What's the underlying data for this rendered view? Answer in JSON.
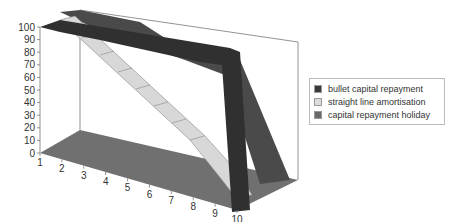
{
  "chart_data": {
    "type": "area",
    "subtype": "3d-ribbon",
    "title": "",
    "xlabel": "",
    "ylabel": "",
    "categories": [
      1,
      2,
      3,
      4,
      5,
      6,
      7,
      8,
      9,
      10
    ],
    "y_ticks": [
      0,
      10,
      20,
      30,
      40,
      50,
      60,
      70,
      80,
      90,
      100
    ],
    "ylim": [
      0,
      100
    ],
    "grid": false,
    "legend_position": "right",
    "series": [
      {
        "name": "bullet capital repayment",
        "color": "#3a3a3a",
        "values": [
          100,
          100,
          100,
          100,
          100,
          100,
          100,
          100,
          100,
          0
        ]
      },
      {
        "name": "straight line amortisation",
        "color": "#d8d8d8",
        "values": [
          100,
          90,
          80,
          70,
          60,
          50,
          40,
          30,
          20,
          10
        ]
      },
      {
        "name": "capital repayment holiday",
        "color": "#555555",
        "values": [
          100,
          100,
          100,
          100,
          100,
          80,
          60,
          40,
          20,
          0
        ]
      }
    ]
  },
  "legend": {
    "items": [
      {
        "label": "bullet capital repayment",
        "color": "#3a3a3a"
      },
      {
        "label": "straight line amortisation",
        "color": "#dcdcdc"
      },
      {
        "label": "capital repayment holiday",
        "color": "#6a6a6a"
      }
    ]
  }
}
